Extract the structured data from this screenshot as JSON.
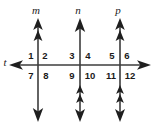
{
  "figure": {
    "background_color": "#ffffff",
    "line_color": "#3d3d3d",
    "text_color": "#1a1a1a",
    "width": 156,
    "height": 124
  },
  "transversal": {
    "label": "t",
    "label_x": 5,
    "label_y": 66,
    "y": 65,
    "x_start": 10,
    "x_end": 150,
    "left_arrow": true,
    "right_arrow": true
  },
  "vertical_lines": [
    {
      "label": "m",
      "label_x": 36,
      "label_y": 14,
      "x": 38,
      "y_top": 22,
      "y_bottom": 118,
      "top_arrowheads": 2,
      "bottom_arrowheads": 1
    },
    {
      "label": "n",
      "label_x": 78,
      "label_y": 14,
      "x": 80,
      "y_top": 22,
      "y_bottom": 118,
      "top_arrowheads": 1,
      "bottom_arrowheads": 3
    },
    {
      "label": "p",
      "label_x": 118,
      "label_y": 14,
      "x": 120,
      "y_top": 22,
      "y_bottom": 118,
      "top_arrowheads": 2,
      "bottom_arrowheads": 3
    }
  ],
  "angle_numbers": [
    {
      "text": "1",
      "x": 31,
      "y": 59
    },
    {
      "text": "2",
      "x": 45,
      "y": 59
    },
    {
      "text": "3",
      "x": 72,
      "y": 59
    },
    {
      "text": "4",
      "x": 88,
      "y": 59
    },
    {
      "text": "5",
      "x": 112,
      "y": 59
    },
    {
      "text": "6",
      "x": 127,
      "y": 59
    },
    {
      "text": "7",
      "x": 31,
      "y": 79
    },
    {
      "text": "8",
      "x": 46,
      "y": 79
    },
    {
      "text": "9",
      "x": 72,
      "y": 79
    },
    {
      "text": "10",
      "x": 90,
      "y": 79
    },
    {
      "text": "11",
      "x": 111,
      "y": 79
    },
    {
      "text": "12",
      "x": 130,
      "y": 79
    }
  ]
}
